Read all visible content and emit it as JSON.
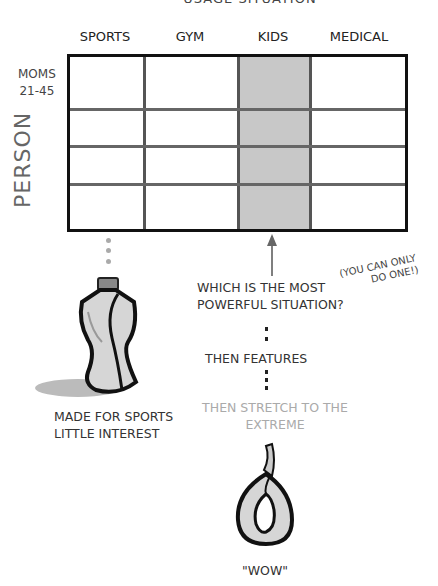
{
  "title": "USAGE SITUATION",
  "columns": [
    "SPORTS",
    "GYM",
    "KIDS",
    "MEDICAL"
  ],
  "highlighted_column": "KIDS",
  "row_label": {
    "line1": "MOMS",
    "line2": "21-45"
  },
  "axis_label": "PERSON",
  "question": {
    "line1": "WHICH IS THE MOST",
    "line2": "POWERFUL SITUATION?"
  },
  "aside": {
    "line1": "(YOU CAN ONLY",
    "line2": "DO ONE!)"
  },
  "step_features": "THEN FEATURES",
  "step_stretch": {
    "line1": "THEN STRETCH TO THE",
    "line2": "EXTREME"
  },
  "sports_caption": {
    "line1": "MADE FOR SPORTS",
    "line2": "LITTLE INTEREST"
  },
  "wow_caption": "\"WOW\"",
  "colors": {
    "shade": "#c8c8c8",
    "grid": "#111111",
    "muted_text": "#aaaaaa"
  }
}
